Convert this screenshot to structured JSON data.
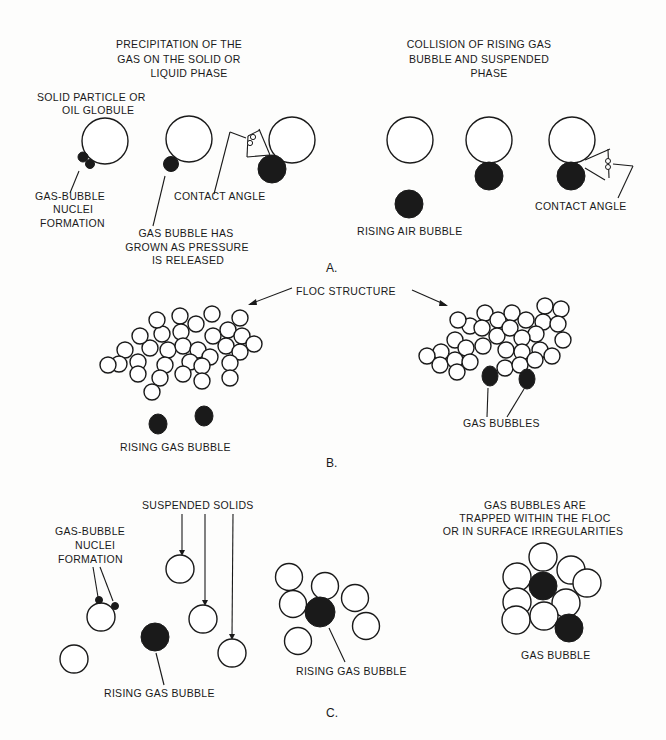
{
  "figure": {
    "panels": [
      {
        "id": "A",
        "label": "A.",
        "left_title": [
          "PRECIPITATION OF THE",
          "GAS ON THE SOLID OR",
          "LIQUID PHASE"
        ],
        "right_title": [
          "COLLISION OF RISING GAS",
          "BUBBLE AND SUSPENDED",
          "PHASE"
        ],
        "labels": {
          "solid_particle": [
            "SOLID PARTICLE OR",
            "OIL GLOBULE"
          ],
          "nuclei": [
            "GAS-BUBBLE",
            "NUCLEI",
            "FORMATION"
          ],
          "grown": [
            "GAS BUBBLE HAS",
            "GROWN AS PRESSURE",
            "IS RELEASED"
          ],
          "contact_angle_left": "CONTACT ANGLE",
          "rising_air": "RISING AIR BUBBLE",
          "contact_angle_right": "CONTACT ANGLE"
        }
      },
      {
        "id": "B",
        "label": "B.",
        "labels": {
          "floc_structure": "FLOC STRUCTURE",
          "rising_gas_bubble": "RISING GAS BUBBLE",
          "gas_bubbles": "GAS BUBBLES"
        }
      },
      {
        "id": "C",
        "label": "C.",
        "labels": {
          "suspended_solids": "SUSPENDED SOLIDS",
          "nuclei": [
            "GAS-BUBBLE",
            "NUCLEI",
            "FORMATION"
          ],
          "rising_gas_bubble_left": "RISING GAS BUBBLE",
          "rising_gas_bubble_mid": "RISING GAS BUBBLE",
          "trapped": [
            "GAS BUBBLES ARE",
            "TRAPPED WITHIN THE FLOC",
            "OR IN SURFACE IRREGULARITIES"
          ],
          "gas_bubble": "GAS BUBBLE"
        }
      }
    ]
  }
}
